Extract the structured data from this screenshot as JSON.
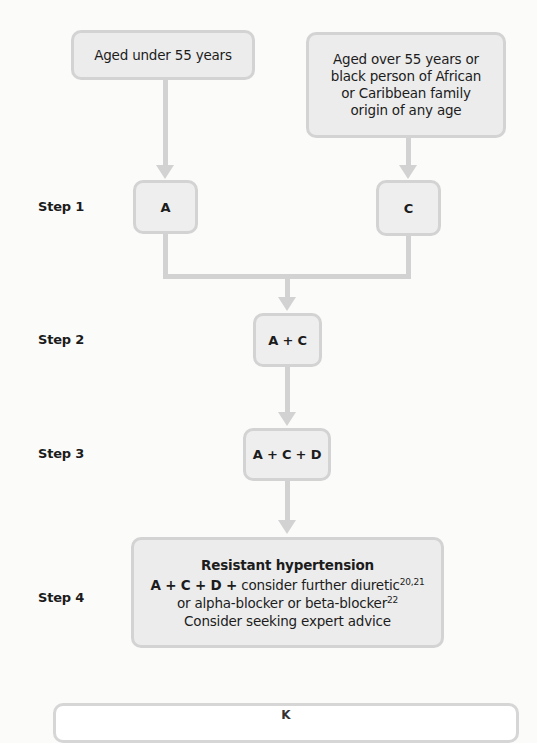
{
  "diagram": {
    "type": "flowchart",
    "entry_nodes": [
      {
        "id": "under55",
        "text": "Aged under 55 years"
      },
      {
        "id": "over55",
        "lines": [
          "Aged over 55 years or",
          "black person of African",
          "or Caribbean family",
          "origin of any age"
        ]
      }
    ],
    "steps": [
      {
        "label": "Step 1",
        "nodes": [
          "A",
          "C"
        ]
      },
      {
        "label": "Step 2",
        "nodes": [
          "A + C"
        ]
      },
      {
        "label": "Step 3",
        "nodes": [
          "A + C + D"
        ]
      },
      {
        "label": "Step 4",
        "nodes": [
          "Resistant hypertension"
        ]
      }
    ],
    "step4": {
      "title": "Resistant hypertension",
      "line1_bold": "A + C + D +",
      "line1_text": " consider further diuretic",
      "line1_sup": "20,21",
      "line2_text": "or alpha-blocker or beta-blocker",
      "line2_sup": "22",
      "line3_text": "Consider seeking expert advice"
    },
    "edges": [
      [
        "under55",
        "A"
      ],
      [
        "over55",
        "C"
      ],
      [
        "A",
        "A + C"
      ],
      [
        "C",
        "A + C"
      ],
      [
        "A + C",
        "A + C + D"
      ],
      [
        "A + C + D",
        "Resistant hypertension"
      ]
    ],
    "key_box": {
      "label": "K"
    },
    "colors": {
      "box_fill": "#ececec",
      "box_border": "#d3d3d3",
      "connector": "#d2d2d2",
      "background": "#fbfbfa"
    }
  }
}
